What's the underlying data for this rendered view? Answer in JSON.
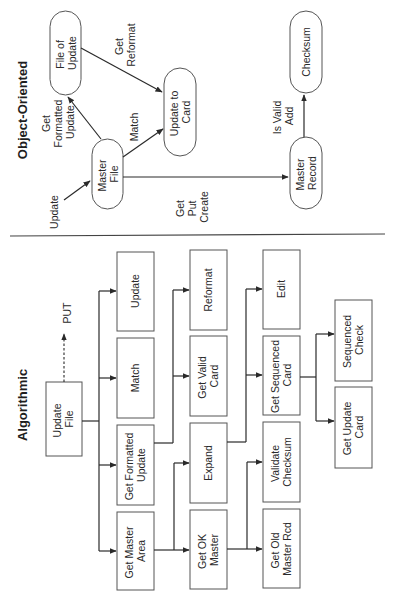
{
  "orientation": "rotated 90 degrees counter-clockwise",
  "object_oriented": {
    "title": "Object-Oriented",
    "nodes": {
      "master_file": [
        "Master",
        "File"
      ],
      "file_of_update": [
        "File of",
        "Update"
      ],
      "update_to_card": [
        "Update to",
        "Card"
      ],
      "master_record": [
        "Master",
        "Record"
      ],
      "checksum": [
        "Checksum"
      ]
    },
    "edge_labels": {
      "update": [
        "Update"
      ],
      "get_formatted_update": [
        "Get",
        "Formatted",
        "Update"
      ],
      "get_reformat": [
        "Get",
        "Reformat"
      ],
      "match": [
        "Match"
      ],
      "get_put_create": [
        "Get",
        "Put",
        "Create"
      ],
      "is_valid_add": [
        "Is Valid",
        "Add"
      ]
    }
  },
  "algorithmic": {
    "title": "Algorithmic",
    "root": [
      "Update",
      "File"
    ],
    "put_label": "PUT",
    "level1": [
      [
        "Update"
      ],
      [
        "Match"
      ],
      [
        "Get Formatted",
        "Update"
      ],
      [
        "Get Master",
        "Area"
      ]
    ],
    "level2": [
      [
        "Reformat"
      ],
      [
        "Get Valid",
        "Card"
      ],
      [
        "Expand"
      ],
      [
        "Get OK",
        "Master"
      ]
    ],
    "level3": [
      [
        "Edit"
      ],
      [
        "Get Sequenced",
        "Card"
      ],
      [
        "Validate",
        "Checksum"
      ],
      [
        "Get Old",
        "Master Rcd"
      ]
    ],
    "level4": [
      [
        "Sequenced",
        "Check"
      ],
      [
        "Get Update",
        "Card"
      ]
    ]
  }
}
